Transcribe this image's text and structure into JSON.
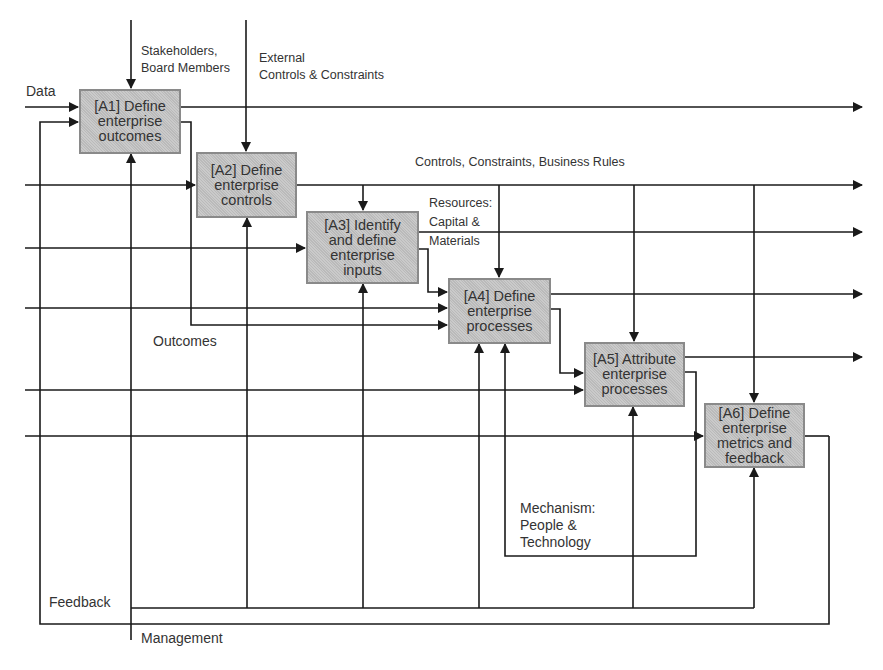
{
  "diagram": {
    "type": "IDEF0 process flow",
    "boxes": [
      {
        "id": "A1",
        "label": "[A1] Define\nenterprise\noutcomes"
      },
      {
        "id": "A2",
        "label": "[A2] Define\nenterprise\ncontrols"
      },
      {
        "id": "A3",
        "label": "[A3] Identify\nand define\nenterprise\ninputs"
      },
      {
        "id": "A4",
        "label": "[A4] Define\nenterprise\nprocesses"
      },
      {
        "id": "A5",
        "label": "[A5] Attribute\nenterprise\nprocesses"
      },
      {
        "id": "A6",
        "label": "[A6] Define\nenterprise\nmetrics and\nfeedback"
      }
    ],
    "labels": {
      "data": "Data",
      "stakeholders": "Stakeholders,\nBoard Members",
      "external_controls": "External\nControls & Constraints",
      "controls_rules": "Controls, Constraints, Business Rules",
      "resources": "Resources:\nCapital &\nMaterials",
      "outcomes": "Outcomes",
      "mechanism": "Mechanism:\nPeople &\nTechnology",
      "feedback": "Feedback",
      "management": "Management"
    },
    "colors": {
      "box_fill": "#c4c4c4",
      "box_border": "#8a8a8a",
      "line": "#1a1a1a",
      "text": "#333333",
      "background": "#ffffff"
    }
  }
}
